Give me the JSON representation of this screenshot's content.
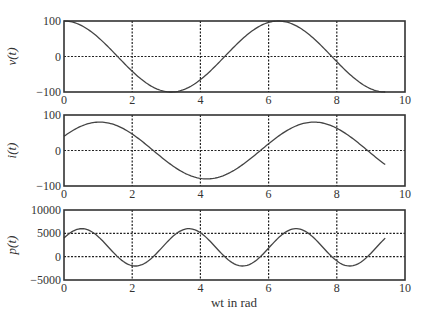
{
  "chart_data": [
    {
      "type": "line",
      "ylabel": "v(t)",
      "xlabel": "",
      "xlim": [
        0,
        10
      ],
      "ylim": [
        -100,
        100
      ],
      "xticks": [
        "0",
        "2",
        "4",
        "6",
        "8",
        "10"
      ],
      "yticks": [
        "100",
        "0",
        "-100"
      ],
      "grid": true,
      "series": [
        {
          "name": "v(t)",
          "formula": "100*cos(wt)",
          "amplitude": 100,
          "phase": 0,
          "x_range": [
            0,
            9.42
          ]
        }
      ],
      "x": [
        0,
        0.5,
        1,
        1.5,
        2,
        2.5,
        3,
        3.5,
        4,
        4.5,
        5,
        5.5,
        6,
        6.5,
        7,
        7.5,
        8,
        8.5,
        9,
        9.42
      ],
      "values": [
        100,
        88,
        54,
        7,
        -42,
        -80,
        -99,
        -94,
        -65,
        -21,
        28,
        71,
        96,
        98,
        75,
        35,
        -15,
        -60,
        -91,
        -100
      ]
    },
    {
      "type": "line",
      "ylabel": "i(t)",
      "xlabel": "",
      "xlim": [
        0,
        10
      ],
      "ylim": [
        -100,
        100
      ],
      "xticks": [
        "0",
        "2",
        "4",
        "6",
        "8",
        "10"
      ],
      "yticks": [
        "100",
        "0",
        "-100"
      ],
      "grid": true,
      "series": [
        {
          "name": "i(t)",
          "formula": "80*cos(wt - pi/3)",
          "amplitude": 80,
          "phase_rad": -1.047,
          "x_range": [
            0,
            9.42
          ]
        }
      ],
      "x": [
        0,
        0.5,
        1,
        1.5,
        2,
        2.5,
        3,
        3.5,
        4,
        4.5,
        5,
        5.5,
        6,
        6.5,
        7,
        7.5,
        8,
        8.5,
        9,
        9.42
      ],
      "values": [
        40,
        70,
        80,
        69,
        40,
        0,
        -40,
        -70,
        -80,
        -70,
        -42,
        -3,
        37,
        68,
        80,
        71,
        44,
        6,
        -34,
        -40
      ]
    },
    {
      "type": "line",
      "ylabel": "p(t)",
      "xlabel": "wt in rad",
      "xlim": [
        0,
        10
      ],
      "ylim": [
        -5000,
        10000
      ],
      "xticks": [
        "0",
        "2",
        "4",
        "6",
        "8",
        "10"
      ],
      "yticks": [
        "10000",
        "5000",
        "0",
        "-5000"
      ],
      "grid": true,
      "series": [
        {
          "name": "p(t)",
          "formula": "2000 + 4000*cos(2*wt - pi/3)",
          "average": 2000,
          "amplitude": 4000,
          "x_range": [
            0,
            9.42
          ]
        }
      ],
      "x": [
        0,
        0.5,
        1,
        1.5,
        2,
        2.5,
        3,
        3.5,
        4,
        4.5,
        5,
        5.5,
        6,
        6.5,
        7,
        7.5,
        8,
        8.5,
        9,
        9.42
      ],
      "values": [
        4000,
        6000,
        4400,
        400,
        -1700,
        -200,
        3700,
        5900,
        5100,
        1600,
        -1600,
        -1100,
        2500,
        5600,
        5700,
        2800,
        -900,
        -1600,
        1300,
        4000
      ]
    }
  ],
  "labels": {
    "p1_ylabel": "v(t)",
    "p2_ylabel": "i(t)",
    "p3_ylabel": "p(t)",
    "xlabel": "wt in rad"
  }
}
